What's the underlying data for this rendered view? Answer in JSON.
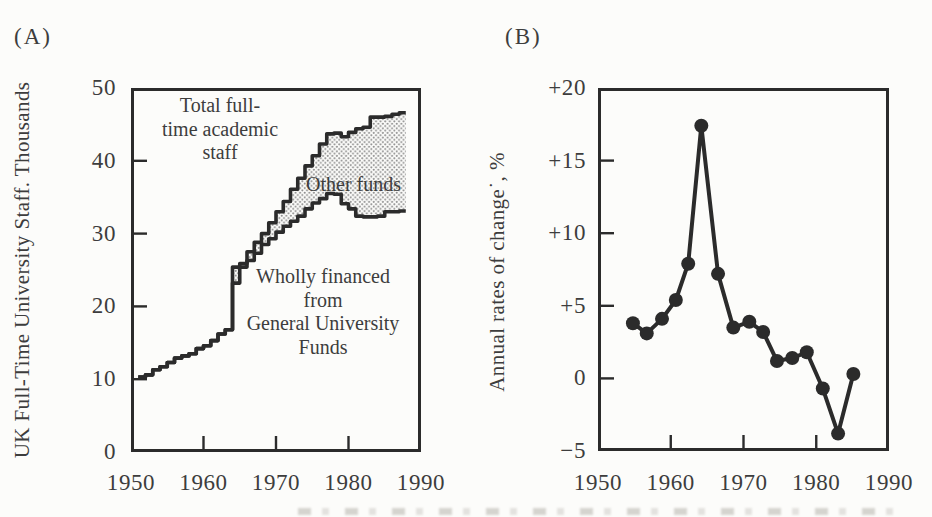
{
  "figure": {
    "colors": {
      "paper": "#fcfcfa",
      "ink": "#2b2b2b",
      "text_ink": "#3d3d3d",
      "stipple_dot": "#8f8f8f"
    }
  },
  "chart_data": [
    {
      "id": "A",
      "type": "area",
      "panel_tag": "(A)",
      "ylabel": "UK Full-Time University Staff. Thousands",
      "xlabel": "",
      "xlim": [
        1950,
        1990
      ],
      "ylim": [
        0,
        50
      ],
      "grid": false,
      "step": true,
      "x_ticks": [
        1950,
        1960,
        1970,
        1980,
        1990
      ],
      "x_tick_labels": [
        "1950",
        "1960",
        "1970",
        "1980",
        "1990"
      ],
      "y_ticks": [
        50,
        40,
        30,
        20,
        10,
        0
      ],
      "y_tick_labels": [
        "50",
        "40",
        "30",
        "20",
        "10",
        "0"
      ],
      "years": [
        1951,
        1952,
        1953,
        1954,
        1955,
        1956,
        1957,
        1958,
        1959,
        1960,
        1961,
        1962,
        1963,
        1964,
        1965,
        1966,
        1967,
        1968,
        1969,
        1970,
        1971,
        1972,
        1973,
        1974,
        1975,
        1976,
        1977,
        1978,
        1979,
        1980,
        1981,
        1982,
        1983,
        1984,
        1985,
        1986,
        1987
      ],
      "series": [
        {
          "name": "Total full-time academic staff",
          "values": [
            10.3,
            10.6,
            11.3,
            11.7,
            12.3,
            12.9,
            13.2,
            13.5,
            14.2,
            14.6,
            15.3,
            16.2,
            16.8,
            25.4,
            25.9,
            27.5,
            28.8,
            30.0,
            31.5,
            33.0,
            34.4,
            36.1,
            37.6,
            39.3,
            40.7,
            42.3,
            43.7,
            43.8,
            43.3,
            43.9,
            44.4,
            44.6,
            46.0,
            46.0,
            46.1,
            46.4,
            46.6
          ]
        },
        {
          "name": "Wholly financed from General University Funds",
          "values": [
            10.3,
            10.6,
            11.3,
            11.7,
            12.3,
            12.9,
            13.2,
            13.5,
            14.2,
            14.6,
            15.3,
            16.2,
            16.8,
            23.2,
            25.4,
            26.3,
            27.3,
            28.5,
            29.3,
            30.2,
            31.0,
            31.7,
            32.4,
            33.4,
            34.2,
            34.8,
            35.5,
            35.4,
            34.1,
            33.4,
            32.4,
            32.3,
            32.3,
            32.4,
            33.0,
            33.0,
            33.1
          ]
        }
      ],
      "band_label": "Other funds",
      "annotations": [
        {
          "text": "Total full-\ntime academic\nstaff",
          "x": 220,
          "y": 94,
          "align": "center"
        },
        {
          "text": "Other funds",
          "x": 306,
          "y": 173,
          "align": "left"
        },
        {
          "text": "Wholly financed\nfrom\nGeneral University\nFunds",
          "x": 323,
          "y": 265,
          "align": "center"
        }
      ]
    },
    {
      "id": "B",
      "type": "line",
      "panel_tag": "(B)",
      "ylabel": "Annual rates of change˙, %",
      "xlabel": "",
      "xlim": [
        1950,
        1990
      ],
      "ylim": [
        -5,
        20
      ],
      "grid": false,
      "x_ticks": [
        1950,
        1960,
        1970,
        1980,
        1990
      ],
      "x_tick_labels": [
        "1950",
        "1960",
        "1970",
        "1980",
        "1990"
      ],
      "y_ticks": [
        20,
        15,
        10,
        5,
        0,
        -5
      ],
      "y_tick_labels": [
        "+20",
        "+15",
        "+10",
        "+5",
        "0",
        "−5"
      ],
      "x": [
        1954.8,
        1956.7,
        1958.8,
        1960.7,
        1962.4,
        1964.2,
        1966.5,
        1968.6,
        1970.8,
        1972.7,
        1974.6,
        1976.7,
        1978.7,
        1980.9,
        1983.0,
        1985.1
      ],
      "y": [
        3.8,
        3.1,
        4.1,
        5.4,
        7.9,
        17.4,
        7.2,
        3.5,
        3.9,
        3.2,
        1.2,
        1.4,
        1.8,
        -0.7,
        -3.8,
        0.3
      ]
    }
  ]
}
